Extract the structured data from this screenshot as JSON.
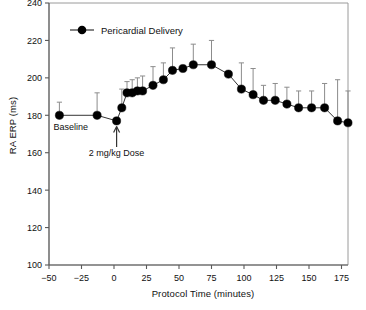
{
  "chart_data": {
    "type": "line",
    "title": "",
    "xlabel": "Protocol Time (minutes)",
    "ylabel": "RA ERP (ms)",
    "xlim": [
      -50,
      180
    ],
    "ylim": [
      100,
      240
    ],
    "xticks": [
      -50,
      -25,
      0,
      25,
      50,
      75,
      100,
      125,
      150,
      175
    ],
    "xticklabels": [
      "−50",
      "−25",
      "0",
      "25",
      "50",
      "75",
      "100",
      "125",
      "150",
      "175"
    ],
    "yticks": [
      100,
      120,
      140,
      160,
      180,
      200,
      220,
      240
    ],
    "yticklabels": [
      "100",
      "120",
      "140",
      "160",
      "180",
      "200",
      "220",
      "240"
    ],
    "grid": false,
    "legend": {
      "position": "top-left-inside",
      "entries": [
        "Pericardial Delivery"
      ]
    },
    "annotations": [
      {
        "text": "Baseline",
        "x": -42,
        "y": 172,
        "name": "baseline-label"
      },
      {
        "text": "2 mg/kg Dose",
        "x": 2,
        "y": 158,
        "name": "dose-label"
      },
      {
        "text": "dose-arrow",
        "x": 2,
        "y_from": 163,
        "y_to": 174,
        "name": "dose-arrow"
      }
    ],
    "series": [
      {
        "name": "Pericardial Delivery",
        "marker": "filled-circle",
        "color": "#000000",
        "errorbar": "upper-only",
        "x": [
          -42,
          -13,
          2,
          6,
          10,
          14,
          18,
          22,
          30,
          38,
          45,
          53,
          61,
          75,
          88,
          98,
          107,
          115,
          124,
          133,
          142,
          152,
          162,
          172,
          180
        ],
        "y": [
          180,
          180,
          177,
          184,
          192,
          192,
          193,
          193,
          196,
          199,
          204,
          205,
          207,
          207,
          202,
          194,
          191,
          188,
          188,
          186,
          184,
          184,
          184,
          177,
          176
        ],
        "yerr_upper": [
          7,
          12,
          0,
          10,
          6,
          7,
          7,
          8,
          10,
          9,
          12,
          0,
          11,
          13,
          0,
          14,
          14,
          8,
          9,
          9,
          9,
          9,
          13,
          22,
          17
        ]
      }
    ]
  }
}
